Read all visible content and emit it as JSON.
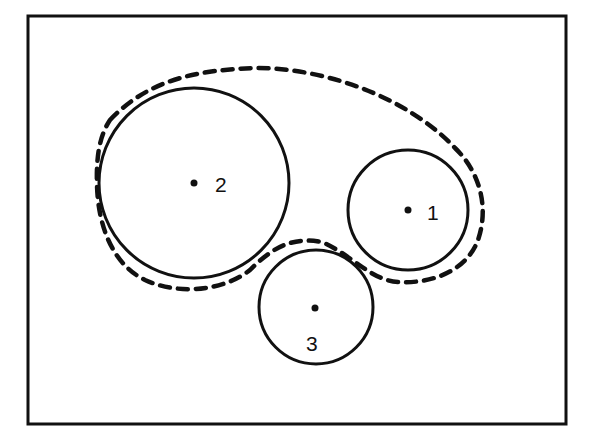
{
  "diagram": {
    "frame": {
      "x": 28,
      "y": 16,
      "width": 538,
      "height": 408,
      "stroke": "#111111"
    },
    "circles": [
      {
        "id": "1",
        "label": "1",
        "cx": 408,
        "cy": 210,
        "r": 60,
        "label_x": 428,
        "label_y": 220
      },
      {
        "id": "2",
        "label": "2",
        "cx": 194,
        "cy": 183,
        "r": 95,
        "label_x": 215,
        "label_y": 192
      },
      {
        "id": "3",
        "label": "3",
        "cx": 316,
        "cy": 307,
        "r": 57,
        "label_x": 306,
        "label_y": 351
      }
    ],
    "boundary": {
      "style": "dashed",
      "description": "Dashed envelope enclosing circles 1, 2 and 3",
      "stroke": "#111111"
    }
  }
}
